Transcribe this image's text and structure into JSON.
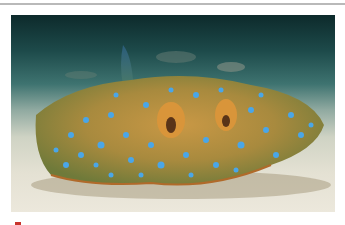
{
  "image": {
    "subject": "blue-spotted stingray resting on sandy sea floor",
    "alt": "Blue-spotted stingray on sand"
  },
  "colors": {
    "rule": "#b9b9b9",
    "water_dark": "#0d2a2b",
    "sand": "#e4e1d3",
    "ray_body": "#b88a3a",
    "spots": "#4aa6e8",
    "accent_red": "#c8342c"
  }
}
